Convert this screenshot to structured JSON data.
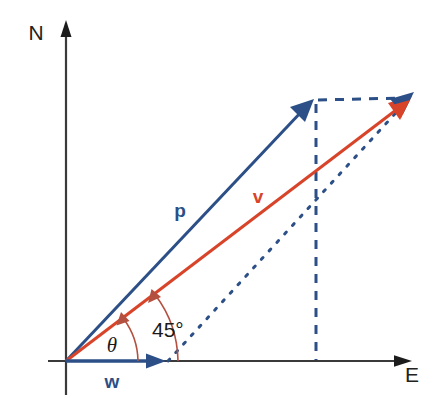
{
  "figure": {
    "kind": "vector-diagram",
    "background_color": "#ffffff",
    "width": 443,
    "height": 416
  },
  "colors": {
    "axis": "#3a3a3a",
    "vector_blue": "#2b4f86",
    "vector_red": "#d8442a",
    "dashed_blue": "#2b4f86",
    "arc_red": "#b4503f",
    "text": "#1a1a1a"
  },
  "axes": {
    "origin": {
      "x": 66,
      "y": 361
    },
    "north": {
      "label": "N",
      "label_x": 36,
      "label_y": 40,
      "tip_x": 66,
      "tip_y": 22
    },
    "east": {
      "label": "E",
      "label_x": 412,
      "label_y": 382,
      "tip_x": 412,
      "tip_y": 361
    }
  },
  "vectors": [
    {
      "name": "p",
      "label": "p",
      "color": "#2b4f86",
      "label_x": 180,
      "label_y": 217,
      "from": {
        "x": 66,
        "y": 361
      },
      "to": {
        "x": 313,
        "y": 100
      },
      "style": "solid",
      "arrowhead": true
    },
    {
      "name": "v",
      "label": "v",
      "color": "#d8442a",
      "label_x": 258,
      "label_y": 203,
      "from": {
        "x": 66,
        "y": 361
      },
      "to": {
        "x": 411,
        "y": 98
      },
      "style": "solid",
      "arrowhead": true
    },
    {
      "name": "w",
      "label": "w",
      "color": "#2b4f86",
      "label_x": 112,
      "label_y": 388,
      "from": {
        "x": 66,
        "y": 361
      },
      "to": {
        "x": 166,
        "y": 361
      },
      "style": "solid",
      "arrowhead": true
    }
  ],
  "construction_lines": [
    {
      "name": "vertical-drop-from-p-tip",
      "from": {
        "x": 316,
        "y": 103
      },
      "to": {
        "x": 316,
        "y": 361
      },
      "style": "dashed",
      "color": "#2b4f86"
    },
    {
      "name": "horizontal-p-tip-to-v-tip",
      "from": {
        "x": 318,
        "y": 100
      },
      "to": {
        "x": 406,
        "y": 98
      },
      "style": "dashed",
      "color": "#2b4f86"
    },
    {
      "name": "diagonal-w-tip-to-v-tip",
      "from": {
        "x": 168,
        "y": 361
      },
      "to": {
        "x": 404,
        "y": 104
      },
      "style": "dashed",
      "color": "#2b4f86"
    }
  ],
  "angles": [
    {
      "name": "theta",
      "label": "θ",
      "label_x": 112,
      "label_y": 352,
      "color": "#b4503f",
      "arrowhead": true,
      "arc": {
        "cx": 66,
        "cy": 361,
        "radius": 72,
        "start_deg": 0,
        "end_deg": 37
      }
    },
    {
      "name": "forty-five-degrees",
      "label": "45°",
      "label_x": 134,
      "label_y": 337,
      "color": "#b4503f",
      "arrowhead": true,
      "arc": {
        "cx": 66,
        "cy": 361,
        "radius": 112,
        "start_deg": 0,
        "end_deg": 37
      }
    }
  ]
}
